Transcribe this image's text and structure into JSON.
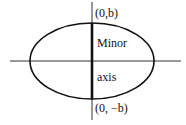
{
  "diagram": {
    "type": "ellipse-minor-axis",
    "labels": {
      "top_point": "(0,b)",
      "bottom_point": "(0, −b)",
      "axis_name_line1": "Minor",
      "axis_name_line2": "axis"
    },
    "colors": {
      "stroke": "#111111",
      "background": "#ffffff"
    }
  }
}
